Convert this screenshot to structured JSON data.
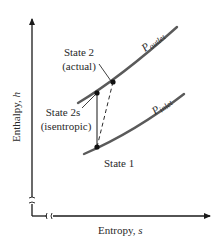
{
  "diagram": {
    "type": "h-s diagram (turbine/compressor process)",
    "axes": {
      "y_label": "Enthalpy, ",
      "y_symbol": "h",
      "x_label": "Entropy, ",
      "x_symbol": "s",
      "axis_breaks": true
    },
    "curves": [
      {
        "id": "p-outlet",
        "label_main": "P",
        "label_sub": "outlet"
      },
      {
        "id": "p-inlet",
        "label_main": "P",
        "label_sub": "inlet"
      }
    ],
    "states": [
      {
        "id": "state-2-actual",
        "label_line1": "State 2",
        "label_line2": "(actual)"
      },
      {
        "id": "state-2s",
        "label_line1": "State 2s",
        "label_line2": "(isentropic)"
      },
      {
        "id": "state-1",
        "label_line1": "State 1"
      }
    ],
    "colors": {
      "curve": "#5a5a5a",
      "axis": "#1a1a1a",
      "text": "#2a2a2a",
      "point": "#111111"
    }
  }
}
